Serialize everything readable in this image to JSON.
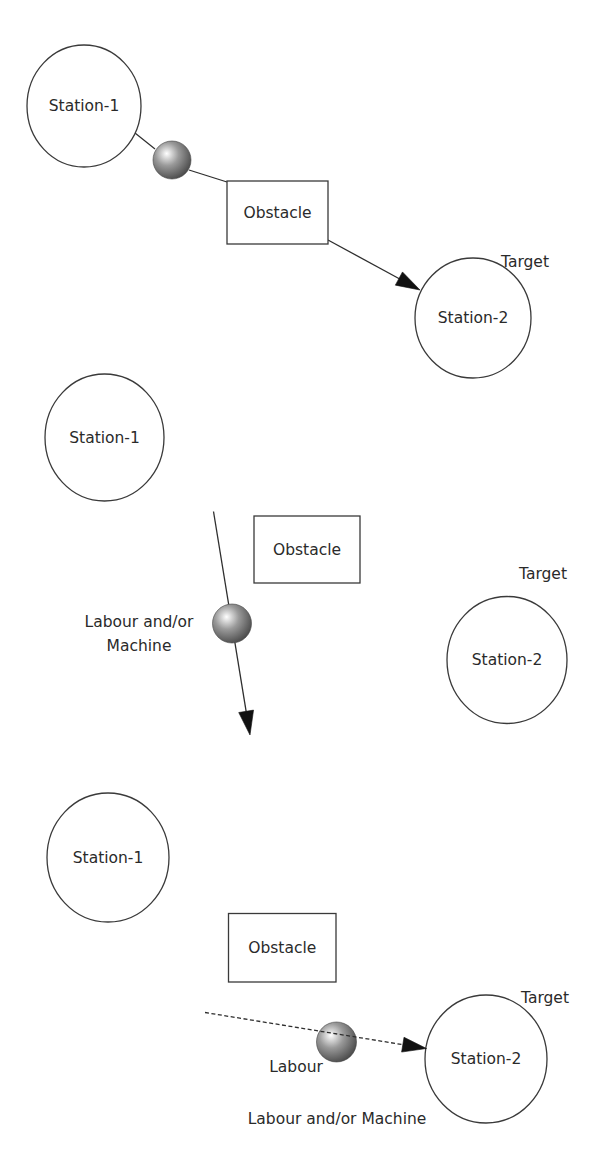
{
  "figure": {
    "panels": [
      {
        "id": "panel-1",
        "stations": [
          {
            "label": "Station-1",
            "cx": 84,
            "cy": 106,
            "rx": 57,
            "ry": 61
          },
          {
            "label": "Station-2",
            "cx": 473,
            "cy": 318,
            "rx": 58,
            "ry": 60
          }
        ],
        "obstacle": {
          "label": "Obstacle",
          "x": 227,
          "y": 181,
          "w": 101,
          "h": 63
        },
        "target_label": {
          "text": "Target",
          "x": 525,
          "y": 262
        },
        "agent": {
          "cx": 172,
          "cy": 160,
          "r": 19
        },
        "edges": [
          {
            "x1": 135,
            "y1": 133,
            "x2": 155,
            "y2": 149,
            "style": "solid",
            "arrow": false
          },
          {
            "x1": 189,
            "y1": 170,
            "x2": 227,
            "y2": 182,
            "style": "solid",
            "arrow": false
          },
          {
            "x1": 328,
            "y1": 240,
            "x2": 420,
            "y2": 290,
            "style": "solid",
            "arrow": true
          }
        ],
        "labels": []
      },
      {
        "id": "panel-2",
        "stations": [
          {
            "label": "Station-1",
            "cx": 104.5,
            "cy": 437.5,
            "rx": 59.5,
            "ry": 63.5
          },
          {
            "label": "Station-2",
            "cx": 507,
            "cy": 660,
            "rx": 60,
            "ry": 63.5
          }
        ],
        "obstacle": {
          "label": "Obstacle",
          "x": 254,
          "y": 516,
          "w": 106,
          "h": 67
        },
        "target_label": {
          "text": "Target",
          "x": 543,
          "y": 574
        },
        "agent": {
          "cx": 232,
          "cy": 623.5,
          "r": 19.5
        },
        "edges": [
          {
            "x1": 213.5,
            "y1": 511.5,
            "x2": 250,
            "y2": 735,
            "style": "solid",
            "arrow": true
          }
        ],
        "labels": [
          {
            "text": "Labour and/or",
            "x": 139,
            "y": 622
          },
          {
            "text": "Machine",
            "x": 139,
            "y": 645.5
          }
        ]
      },
      {
        "id": "panel-3",
        "stations": [
          {
            "label": "Station-1",
            "cx": 108,
            "cy": 857.5,
            "rx": 61,
            "ry": 64.5
          },
          {
            "label": "Station-2",
            "cx": 486,
            "cy": 1059,
            "rx": 61,
            "ry": 64
          }
        ],
        "obstacle": {
          "label": "Obstacle",
          "x": 228.5,
          "y": 913.5,
          "w": 107.5,
          "h": 68.5
        },
        "target_label": {
          "text": "Target",
          "x": 545,
          "y": 998
        },
        "agent": {
          "cx": 336.5,
          "cy": 1042,
          "r": 20
        },
        "edges": [
          {
            "x1": 205,
            "y1": 1012.5,
            "x2": 426.5,
            "y2": 1048.5,
            "style": "dashed",
            "arrow": true
          }
        ],
        "labels": [
          {
            "text": "Labour",
            "x": 296,
            "y": 1067
          },
          {
            "text": "Labour and/or Machine",
            "x": 337,
            "y": 1118.5
          }
        ]
      }
    ]
  },
  "colors": {
    "stroke": "#3a3a3a",
    "text": "#2a2a2a",
    "ball_highlight": "#ffffff",
    "ball_mid": "#9a9a9a",
    "ball_edge": "#4a4a4a"
  }
}
